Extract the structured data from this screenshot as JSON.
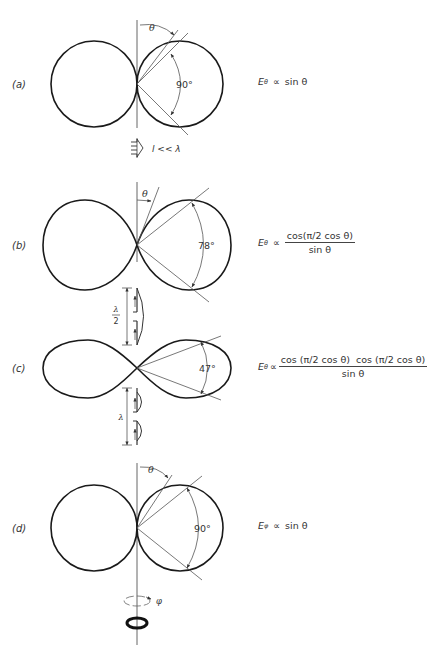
{
  "figure": {
    "panels": [
      {
        "id": "a",
        "label": "(a)",
        "angle_label": "90°",
        "theta_label": "θ",
        "formula": {
          "field": "E",
          "subscript": "θ",
          "proportional": "∝",
          "expression": "sin θ"
        },
        "source": {
          "type": "short dipole",
          "caption": "l << λ"
        }
      },
      {
        "id": "b",
        "label": "(b)",
        "angle_label": "78°",
        "theta_label": "θ",
        "formula": {
          "field": "E",
          "subscript": "θ",
          "proportional": "∝",
          "numerator": "cos(π/2 cos θ)",
          "denominator": "sin θ"
        },
        "source": {
          "type": "half-wave dipole",
          "caption_num": "λ",
          "caption_den": "2"
        }
      },
      {
        "id": "c",
        "label": "(c)",
        "angle_label": "47°",
        "formula": {
          "field": "E",
          "subscript": "θ",
          "proportional": "∝",
          "numerator": "cos (π/2 cos θ)  cos (π/2 cos θ)",
          "denominator": "sin θ"
        },
        "source": {
          "type": "full-wave dipole",
          "caption": "λ"
        }
      },
      {
        "id": "d",
        "label": "(d)",
        "angle_label": "90°",
        "theta_label": "θ",
        "formula": {
          "field": "E",
          "subscript": "φ",
          "proportional": "∝",
          "expression": "sin θ"
        },
        "source": {
          "type": "small loop",
          "caption": "φ"
        }
      }
    ]
  }
}
